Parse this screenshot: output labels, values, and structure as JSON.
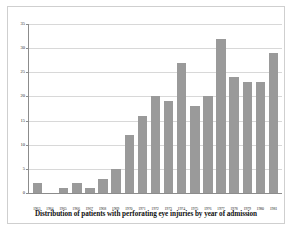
{
  "chart_data": {
    "type": "bar",
    "title": "",
    "caption": "Distribution of patients with perforating eye injuries by year of admission",
    "xlabel": "",
    "ylabel": "",
    "categories": [
      "1963",
      "1964",
      "1965",
      "1966",
      "1967",
      "1968",
      "1969",
      "1970",
      "1971",
      "1972",
      "1973",
      "1974",
      "1975",
      "1976",
      "1977",
      "1978",
      "1979",
      "1980",
      "1981"
    ],
    "values": [
      2,
      0,
      1,
      2,
      1,
      3,
      5,
      12,
      16,
      20,
      19,
      27,
      18,
      20,
      32,
      24,
      23,
      23,
      29
    ],
    "ylim": [
      0,
      35
    ],
    "yticks": [
      0,
      5,
      10,
      15,
      20,
      25,
      30,
      35
    ],
    "ytick_labels": [
      "0",
      "5",
      "10",
      "15",
      "20",
      "25",
      "30",
      "35"
    ],
    "grid": true,
    "legend": "none",
    "bar_color": "#9a9a9a",
    "axis_color": "#8c8c8c",
    "grid_color": "#d8d8d8",
    "background": "#ffffff"
  }
}
